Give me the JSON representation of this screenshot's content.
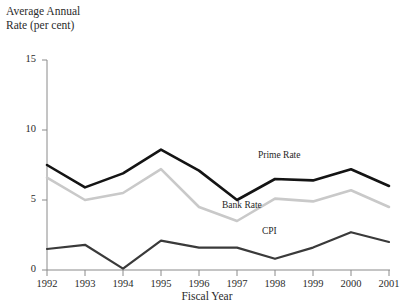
{
  "chart_data": {
    "type": "line",
    "title_line1": "Average Annual",
    "title_line2": "Rate (per cent)",
    "xlabel": "Fiscal Year",
    "ylabel": "Average Annual Rate (per cent)",
    "categories": [
      "1992",
      "1993",
      "1994",
      "1995",
      "1996",
      "1997",
      "1998",
      "1999",
      "2000",
      "2001"
    ],
    "x": [
      1992,
      1993,
      1994,
      1995,
      1996,
      1997,
      1998,
      1999,
      2000,
      2001
    ],
    "ylim": [
      0,
      15
    ],
    "yticks": [
      0,
      5,
      10,
      15
    ],
    "grid": false,
    "legend_position": "inline-annotation",
    "series": [
      {
        "name": "Prime Rate",
        "color": "#141414",
        "width": 2.6,
        "values": [
          7.5,
          5.9,
          6.9,
          8.6,
          7.1,
          5.0,
          6.5,
          6.4,
          7.2,
          6.0
        ]
      },
      {
        "name": "Bank Rate",
        "color": "#c9c9c9",
        "width": 2.6,
        "values": [
          6.6,
          5.0,
          5.5,
          7.2,
          4.5,
          3.5,
          5.1,
          4.9,
          5.7,
          4.5
        ]
      },
      {
        "name": "CPI",
        "color": "#3a3a3a",
        "width": 2.2,
        "values": [
          1.5,
          1.8,
          0.1,
          2.1,
          1.6,
          1.6,
          0.8,
          1.6,
          2.7,
          2.0
        ]
      }
    ],
    "annotations": [
      {
        "text": "Prime Rate",
        "x_px": 258,
        "y_px": 157
      },
      {
        "text": "Bank Rate",
        "x_px": 222,
        "y_px": 207
      },
      {
        "text": "CPI",
        "x_px": 262,
        "y_px": 233
      }
    ]
  },
  "axes": {
    "y_ticks": [
      "15",
      "10",
      "5",
      "0"
    ],
    "x_ticks": [
      "1992",
      "1993",
      "1994",
      "1995",
      "1996",
      "1997",
      "1998",
      "1999",
      "2000",
      "2001"
    ]
  }
}
